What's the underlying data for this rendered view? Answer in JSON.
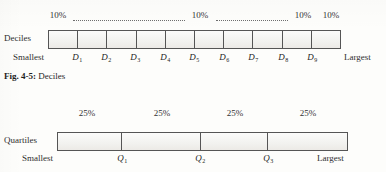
{
  "figure_deciles": {
    "row_label": "Deciles",
    "left_end_label": "Smallest",
    "right_end_label": "Largest",
    "percent_labels": [
      {
        "text": "10%",
        "x": 58
      },
      {
        "text": "10%",
        "x": 200
      },
      {
        "text": "10%",
        "x": 303
      },
      {
        "text": "10%",
        "x": 331
      }
    ],
    "leaders": [
      {
        "x": 73,
        "width": 112
      },
      {
        "x": 216,
        "width": 72
      }
    ],
    "cells": 10,
    "markers": [
      {
        "label": "D",
        "sub": "1",
        "x": 77
      },
      {
        "label": "D",
        "sub": "2",
        "x": 106
      },
      {
        "label": "D",
        "sub": "3",
        "x": 135
      },
      {
        "label": "D",
        "sub": "4",
        "x": 165
      },
      {
        "label": "D",
        "sub": "5",
        "x": 194
      },
      {
        "label": "D",
        "sub": "6",
        "x": 224
      },
      {
        "label": "D",
        "sub": "7",
        "x": 253
      },
      {
        "label": "D",
        "sub": "8",
        "x": 283
      },
      {
        "label": "D",
        "sub": "9",
        "x": 312
      }
    ]
  },
  "caption": {
    "prefix": "Fig.",
    "number": "4-5:",
    "title": "Deciles"
  },
  "figure_quartiles": {
    "row_label": "Quartiles",
    "left_end_label": "Smallest",
    "right_end_label": "Largest",
    "percent_labels": [
      {
        "text": "25%",
        "x": 87
      },
      {
        "text": "25%",
        "x": 162
      },
      {
        "text": "25%",
        "x": 235
      },
      {
        "text": "25%",
        "x": 308
      }
    ],
    "cells": 4,
    "markers": [
      {
        "label": "Q",
        "sub": "1",
        "x": 122
      },
      {
        "label": "Q",
        "sub": "2",
        "x": 200
      },
      {
        "label": "Q",
        "sub": "3",
        "x": 268
      }
    ]
  },
  "colors": {
    "ink": "#2b2b2b",
    "rule": "#555555",
    "cell_fill": "#f4f3f0",
    "paper": "#fdfdfb"
  }
}
